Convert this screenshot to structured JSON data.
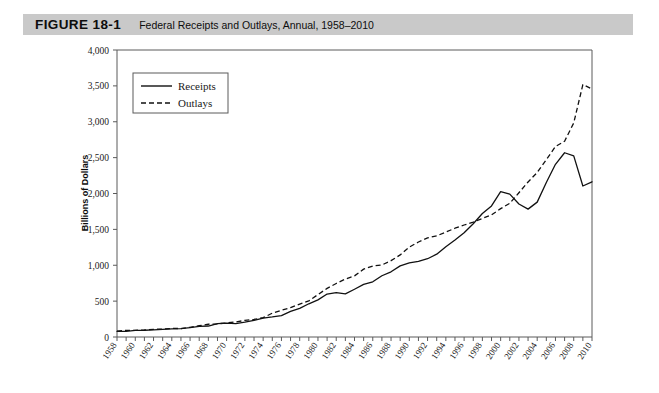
{
  "header": {
    "figure_label": "FIGURE 18-1",
    "figure_title": "Federal Receipts and Outlays, Annual, 1958–2010",
    "bar_color": "#c9c9c9"
  },
  "chart_data": {
    "type": "line",
    "title": "Federal Receipts and Outlays, Annual, 1958–2010",
    "xlabel": "",
    "ylabel": "Billions of Dollars",
    "ylim": [
      0,
      4000
    ],
    "xlim": [
      1958,
      2010
    ],
    "ytick_labels": [
      "0",
      "500",
      "1,000",
      "1,500",
      "2,000",
      "2,500",
      "3,000",
      "3,500",
      "4,000"
    ],
    "ytick_values": [
      0,
      500,
      1000,
      1500,
      2000,
      2500,
      3000,
      3500,
      4000
    ],
    "xtick_labels": [
      "1958",
      "1960",
      "1962",
      "1964",
      "1966",
      "1968",
      "1970",
      "1972",
      "1974",
      "1976",
      "1978",
      "1980",
      "1982",
      "1984",
      "1986",
      "1988",
      "1990",
      "1992",
      "1994",
      "1996",
      "1998",
      "2000",
      "2002",
      "2004",
      "2006",
      "2008",
      "2010"
    ],
    "grid": false,
    "legend_position": "upper-left",
    "legend_entries": [
      "Receipts",
      "Outlays"
    ],
    "x": [
      1958,
      1959,
      1960,
      1961,
      1962,
      1963,
      1964,
      1965,
      1966,
      1967,
      1968,
      1969,
      1970,
      1971,
      1972,
      1973,
      1974,
      1975,
      1976,
      1977,
      1978,
      1979,
      1980,
      1981,
      1982,
      1983,
      1984,
      1985,
      1986,
      1987,
      1988,
      1989,
      1990,
      1991,
      1992,
      1993,
      1994,
      1995,
      1996,
      1997,
      1998,
      1999,
      2000,
      2001,
      2002,
      2003,
      2004,
      2005,
      2006,
      2007,
      2008,
      2009,
      2010
    ],
    "series": [
      {
        "name": "Receipts",
        "style": "solid",
        "color": "#111111",
        "values": [
          79,
          79,
          92,
          94,
          100,
          107,
          113,
          117,
          131,
          149,
          153,
          187,
          193,
          187,
          207,
          231,
          263,
          279,
          298,
          356,
          400,
          463,
          517,
          599,
          618,
          601,
          666,
          734,
          769,
          854,
          909,
          991,
          1032,
          1055,
          1091,
          1154,
          1259,
          1352,
          1453,
          1579,
          1722,
          1827,
          2025,
          1991,
          1853,
          1782,
          1880,
          2154,
          2407,
          2568,
          2524,
          2105,
          2163
        ]
      },
      {
        "name": "Outlays",
        "style": "dashed",
        "color": "#111111",
        "values": [
          82,
          92,
          92,
          98,
          107,
          111,
          119,
          118,
          135,
          157,
          178,
          184,
          196,
          210,
          231,
          246,
          269,
          332,
          372,
          409,
          459,
          504,
          591,
          678,
          746,
          808,
          852,
          946,
          990,
          1004,
          1064,
          1144,
          1253,
          1324,
          1382,
          1409,
          1462,
          1516,
          1561,
          1601,
          1653,
          1702,
          1789,
          1863,
          2011,
          2160,
          2293,
          2472,
          2655,
          2729,
          2983,
          3518,
          3456
        ]
      }
    ]
  },
  "axis": {
    "y_title": "Billions of Dollars"
  },
  "legend": {
    "receipts_label": "Receipts",
    "outlays_label": "Outlays"
  }
}
